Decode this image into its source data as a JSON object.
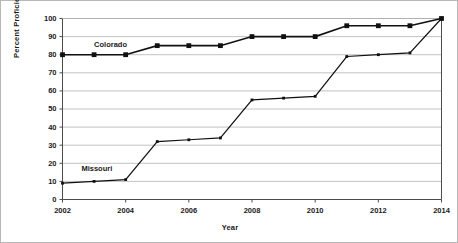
{
  "chart_data": {
    "type": "line",
    "title": "",
    "xlabel": "Year",
    "ylabel": "Percent  Proficient or Above",
    "xlim": [
      2002,
      2014
    ],
    "ylim": [
      0,
      100
    ],
    "ytick_step": 10,
    "xtick_step": 2,
    "grid": "horizontal",
    "legend_position": "inline-labels",
    "x": [
      2002,
      2003,
      2004,
      2005,
      2006,
      2007,
      2008,
      2009,
      2010,
      2011,
      2012,
      2013,
      2014
    ],
    "xticks": [
      "2002",
      "2004",
      "2006",
      "2008",
      "2010",
      "2012",
      "2014"
    ],
    "yticks": [
      "0",
      "10",
      "20",
      "30",
      "40",
      "50",
      "60",
      "70",
      "80",
      "90",
      "100"
    ],
    "series": [
      {
        "name": "Colorado",
        "marker": "square-large",
        "color": "#101010",
        "label_x": 2003.0,
        "label_y": 84,
        "values": [
          80,
          80,
          80,
          85,
          85,
          85,
          90,
          90,
          90,
          96,
          96,
          96,
          100
        ]
      },
      {
        "name": "Missouri",
        "marker": "square-small",
        "color": "#101010",
        "label_x": 2002.6,
        "label_y": 16,
        "values": [
          9,
          10,
          11,
          32,
          33,
          34,
          55,
          56,
          57,
          79,
          80,
          81,
          100
        ]
      }
    ]
  }
}
